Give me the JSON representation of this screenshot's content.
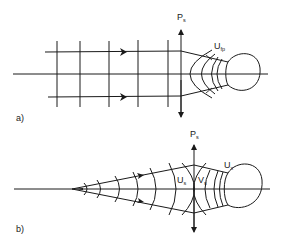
{
  "figure": {
    "panel_a": {
      "label": "a)",
      "axis_label": {
        "main": "P",
        "sub": "s"
      },
      "front_label": {
        "main": "U",
        "sub": "fp"
      }
    },
    "panel_b": {
      "label": "b)",
      "axis_label": {
        "main": "P",
        "sub": "s"
      },
      "left_label": {
        "main": "U",
        "sub": "s"
      },
      "right_label": {
        "main": "V",
        "sub": "s"
      },
      "front_label": {
        "main": "U",
        "sub": "x"
      }
    },
    "colors": {
      "ink": "#1a1a1a",
      "background": "#ffffff"
    }
  }
}
